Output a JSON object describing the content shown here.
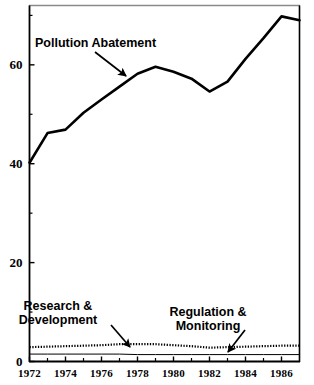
{
  "chart_data": {
    "type": "line",
    "title": "",
    "subtitle": "",
    "xlabel": "",
    "ylabel": "",
    "xlim": [
      1972,
      1987
    ],
    "ylim": [
      0,
      72
    ],
    "grid": false,
    "legend_position": "none",
    "x": [
      1972,
      1973,
      1974,
      1975,
      1976,
      1977,
      1978,
      1979,
      1980,
      1981,
      1982,
      1983,
      1984,
      1985,
      1986,
      1987
    ],
    "xtick_labels": [
      "1972",
      "1974",
      "1976",
      "1978",
      "1980",
      "1982",
      "1984",
      "1986"
    ],
    "xtick_values": [
      1972,
      1974,
      1976,
      1978,
      1980,
      1982,
      1984,
      1986
    ],
    "xminor_values": [
      1973,
      1975,
      1977,
      1979,
      1981,
      1983,
      1985,
      1987
    ],
    "ytick_labels": [
      "0",
      "20",
      "40",
      "60"
    ],
    "ytick_values": [
      0,
      20,
      40,
      60
    ],
    "yminor_values": [
      10,
      30,
      50,
      70
    ],
    "series": [
      {
        "name": "Pollution Abatement",
        "style": "solid",
        "linewidth": 2.6,
        "color": "#000000",
        "values": [
          40.2,
          46.2,
          46.9,
          50.3,
          53.0,
          55.6,
          58.2,
          59.6,
          58.6,
          57.2,
          54.6,
          56.6,
          61.2,
          65.4,
          69.8,
          69.0
        ]
      },
      {
        "name": "Research & Development",
        "style": "dotted",
        "linewidth": 2.2,
        "color": "#000000",
        "values": [
          2.9,
          3.0,
          3.1,
          3.2,
          3.3,
          3.5,
          3.5,
          3.5,
          3.3,
          3.1,
          2.8,
          2.9,
          3.0,
          3.1,
          3.2,
          3.2
        ]
      },
      {
        "name": "Regulation & Monitoring",
        "style": "solid",
        "linewidth": 1.0,
        "color": "#000000",
        "values": [
          1.5,
          1.5,
          1.5,
          1.5,
          1.5,
          1.5,
          1.4,
          1.4,
          1.4,
          1.4,
          1.4,
          1.4,
          1.4,
          1.4,
          1.4,
          1.4
        ]
      }
    ],
    "annotations": [
      {
        "id": "pollution-abatement",
        "lines": [
          "Pollution  Abatement"
        ],
        "text": "Pollution  Abatement",
        "text_x": 35,
        "text_y": 47,
        "arrow_from": [
          95,
          52
        ],
        "arrow_to": [
          126,
          76
        ]
      },
      {
        "id": "research-development",
        "lines": [
          "Research &",
          "Development"
        ],
        "text": "Research & Development",
        "text_x": 58,
        "text_y": 310,
        "arrow_from": [
          111,
          325
        ],
        "arrow_to": [
          130,
          347
        ]
      },
      {
        "id": "regulation-monitoring",
        "lines": [
          "Regulation &",
          "Monitoring"
        ],
        "text": "Regulation & Monitoring",
        "text_x": 208,
        "text_y": 316,
        "arrow_from": [
          245,
          330
        ],
        "arrow_to": [
          228,
          352
        ]
      }
    ]
  }
}
